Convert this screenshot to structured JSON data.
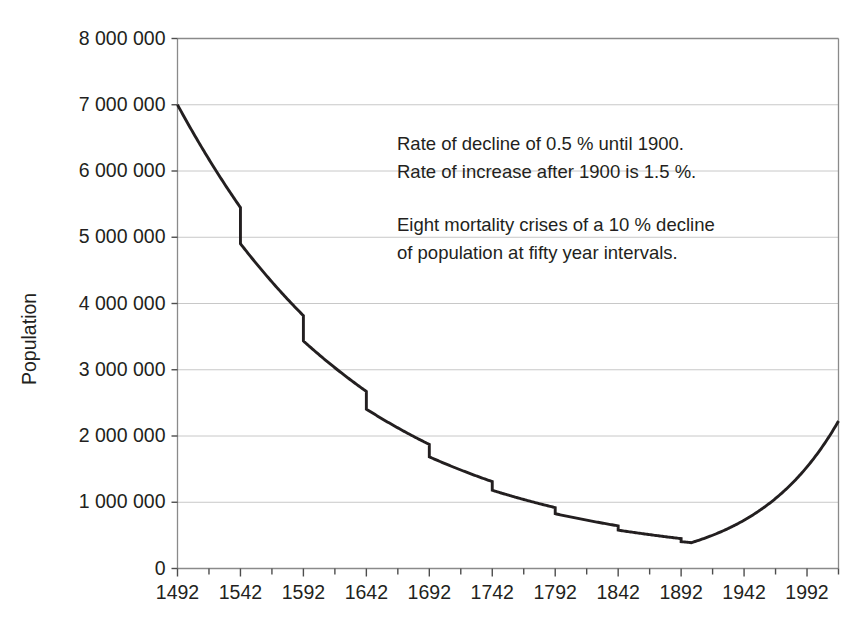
{
  "chart_data": {
    "type": "line",
    "title": "",
    "xlabel": "",
    "ylabel": "Population",
    "xlim": [
      1492,
      2017
    ],
    "ylim": [
      0,
      8000000
    ],
    "grid": true,
    "legend": "none",
    "y_tick_labels": [
      "8 000 000",
      "7 000 000",
      "6 000 000",
      "5 000 000",
      "4 000 000",
      "3 000 000",
      "2 000 000",
      "1 000 000",
      "0"
    ],
    "y_tick_values": [
      8000000,
      7000000,
      6000000,
      5000000,
      4000000,
      3000000,
      2000000,
      1000000,
      0
    ],
    "x_tick_labels": [
      "1492",
      "1542",
      "1592",
      "1642",
      "1692",
      "1742",
      "1792",
      "1842",
      "1892",
      "1942",
      "1992"
    ],
    "x_tick_values": [
      1492,
      1542,
      1592,
      1642,
      1692,
      1742,
      1792,
      1842,
      1892,
      1942,
      1992
    ],
    "x_minor_interval": 25,
    "line_color": "#231f20",
    "grid_color": "#c8c8c8",
    "model": {
      "start_year": 1492,
      "end_year": 2017,
      "start_population": 7000000,
      "decline_rate_pct": 0.5,
      "decline_until_year": 1900,
      "increase_rate_pct": 1.5,
      "crisis_count": 8,
      "crisis_decline_pct": 10,
      "crisis_interval_years": 50,
      "crisis_first_year": 1542
    },
    "annotations": [
      "Rate of decline of 0.5 % until 1900.",
      "Rate of increase after 1900 is 1.5 %.",
      "Eight mortality crises of a 10 % decline",
      "of population at fifty year intervals."
    ],
    "key_points": [
      {
        "year": 1492,
        "population": 7000000
      },
      {
        "year": 1542,
        "population": 5250000
      },
      {
        "year": 1542,
        "population": 4650000
      },
      {
        "year": 1592,
        "population": 3640000
      },
      {
        "year": 1592,
        "population": 3250000
      },
      {
        "year": 1642,
        "population": 2540000
      },
      {
        "year": 1642,
        "population": 2270000
      },
      {
        "year": 1692,
        "population": 1780000
      },
      {
        "year": 1692,
        "population": 1590000
      },
      {
        "year": 1742,
        "population": 1250000
      },
      {
        "year": 1742,
        "population": 1115000
      },
      {
        "year": 1792,
        "population": 875000
      },
      {
        "year": 1792,
        "population": 790000
      },
      {
        "year": 1842,
        "population": 620000
      },
      {
        "year": 1842,
        "population": 555000
      },
      {
        "year": 1892,
        "population": 440000
      },
      {
        "year": 1892,
        "population": 400000
      },
      {
        "year": 1900,
        "population": 390000
      },
      {
        "year": 1942,
        "population": 720000
      },
      {
        "year": 1992,
        "population": 1510000
      },
      {
        "year": 2017,
        "population": 1950000
      }
    ]
  }
}
